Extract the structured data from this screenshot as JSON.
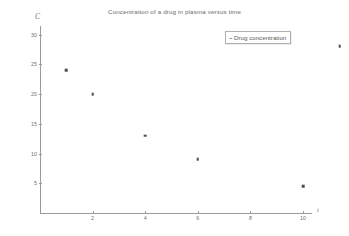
{
  "chart_data": {
    "type": "scatter",
    "title": "Concentration of a drug in plasma versus time",
    "xlabel": "t",
    "ylabel": "C",
    "grid": false,
    "legend_position": "top-right",
    "legend": [
      {
        "name": "Drug concentration",
        "marker": "dash-dot-marker"
      }
    ],
    "xlim": [
      0,
      11.8
    ],
    "ylim": [
      0,
      31.5
    ],
    "xticks": [
      2,
      4,
      6,
      8,
      10
    ],
    "yticks": [
      5,
      10,
      15,
      20,
      25,
      30
    ],
    "series": [
      {
        "name": "Drug concentration",
        "x": [
          1,
          2,
          4,
          6,
          10,
          11.4
        ],
        "y": [
          24,
          20,
          13,
          9,
          4.5,
          28
        ]
      }
    ],
    "marker_color": "#4a4a55",
    "axis_color": "#9a9a9a",
    "text_color": "#6f6f6f"
  },
  "legend": {
    "marker_glyph": "~",
    "label": "Drug concentration"
  }
}
